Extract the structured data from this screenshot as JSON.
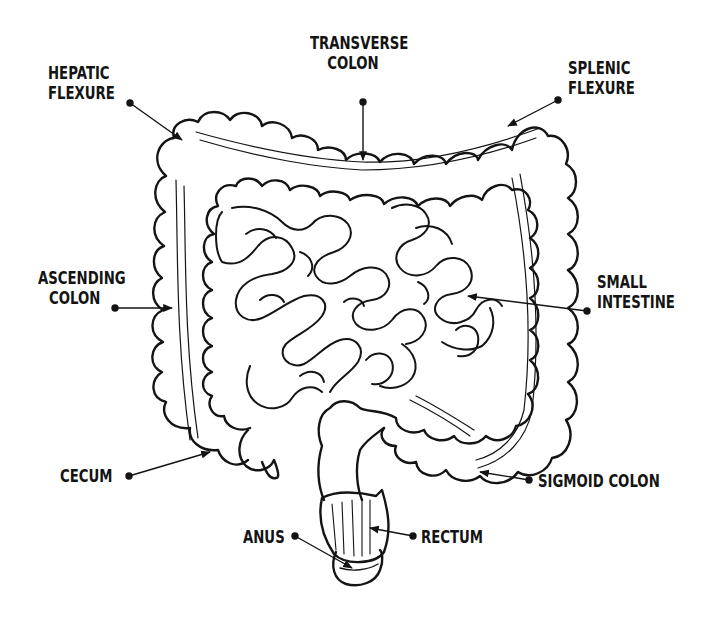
{
  "diagram": {
    "ink_color": "#141414",
    "background": "#ffffff",
    "labels": [
      {
        "id": "hepatic-flexure",
        "lines": [
          "HEPATIC",
          "FLEXURE"
        ]
      },
      {
        "id": "transverse-colon",
        "lines": [
          "TRANSVERSE",
          "COLON"
        ]
      },
      {
        "id": "splenic-flexure",
        "lines": [
          "SPLENIC",
          "FLEXURE"
        ]
      },
      {
        "id": "ascending-colon",
        "lines": [
          "ASCENDING",
          "COLON"
        ]
      },
      {
        "id": "small-intestine",
        "lines": [
          "SMALL",
          "INTESTINE"
        ]
      },
      {
        "id": "cecum",
        "lines": [
          "CECUM"
        ]
      },
      {
        "id": "sigmoid-colon",
        "lines": [
          "SIGMOID COLON"
        ]
      },
      {
        "id": "anus",
        "lines": [
          "ANUS"
        ]
      },
      {
        "id": "rectum",
        "lines": [
          "RECTUM"
        ]
      }
    ]
  }
}
